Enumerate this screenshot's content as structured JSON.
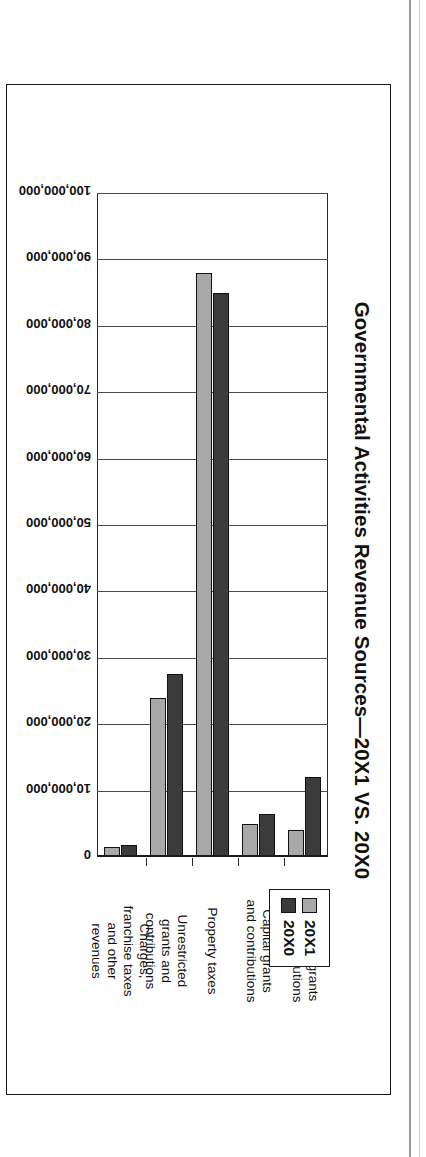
{
  "figure": {
    "title": "Governmental Activities Revenue Sources—20X1 VS. 20X0"
  },
  "legend": {
    "position": "top-right",
    "entries": [
      {
        "label": "20X1",
        "color": "#a8a8a8"
      },
      {
        "label": "20X0",
        "color": "#3b3b3b"
      }
    ]
  },
  "chart_data": {
    "type": "bar",
    "orientation": "horizontal-rotated",
    "title": "Governmental Activities Revenue Sources—20X1 VS. 20X0",
    "xlabel": "",
    "ylabel": "",
    "categories": [
      "Operating grants and contributions",
      "Capital grants and contributions",
      "Property taxes",
      "Unrestricted grants and contributions",
      "Charges, franchise taxes and other revenues"
    ],
    "category_lines": [
      [
        "Operating grants",
        "and contributions"
      ],
      [
        "Capital grants",
        "and contributions"
      ],
      [
        "Property taxes"
      ],
      [
        "Unrestricted",
        "grants and",
        "contributions"
      ],
      [
        "Charges,",
        "franchise taxes",
        "and other",
        "revenues"
      ]
    ],
    "series": [
      {
        "name": "20X1",
        "color": "#a8a8a8",
        "values": [
          4000000,
          5000000,
          88000000,
          24000000,
          1500000
        ]
      },
      {
        "name": "20X0",
        "color": "#3b3b3b",
        "values": [
          12000000,
          6500000,
          85000000,
          27500000,
          1800000
        ]
      }
    ],
    "ylim": [
      0,
      100000000
    ],
    "tick_values": [
      0,
      10000000,
      20000000,
      30000000,
      40000000,
      50000000,
      60000000,
      70000000,
      80000000,
      90000000,
      100000000
    ],
    "tick_labels": [
      "0",
      "10,000,000",
      "20,000,000",
      "30,000,000",
      "40,000,000",
      "50,000,000",
      "60,000,000",
      "70,000,000",
      "80,000,000",
      "90,000,000",
      "100,000,000"
    ],
    "grid": true,
    "legend_position": "top-right"
  }
}
